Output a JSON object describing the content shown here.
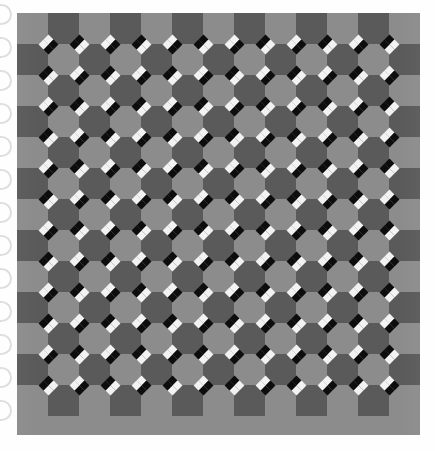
{
  "page": {
    "background_color": "#fefefe",
    "width": 435,
    "height": 451
  },
  "binding": {
    "name": "spiral-binding-holes",
    "hole_count": 13,
    "first_hole_y": 4,
    "spacing": 33,
    "ring_color": "#d8d8d8",
    "hole_fill": "#ffffff"
  },
  "figure": {
    "name": "checkerboard-illusion",
    "type": "optical-illusion-checkerboard",
    "left": 17,
    "top": 13,
    "width": 403,
    "height": 422,
    "columns": 13,
    "rows": 13,
    "cell_size": 31,
    "light_square_color": "#8c8c8c",
    "dark_square_color": "#5a5a5a",
    "diamond_white_color": "#f2f2f2",
    "diamond_black_color": "#0d0d0d",
    "diamond_size": 7,
    "diamond_offset": 5,
    "clusters_per_intersection": 4,
    "intersection_rows": 12,
    "intersection_cols": 12
  },
  "chart_data": {
    "type": "heatmap",
    "title": "",
    "xlabel": "",
    "ylabel": "",
    "categories": [],
    "values": [],
    "note": "Not a data chart; a geometric checkerboard illusion pattern."
  }
}
